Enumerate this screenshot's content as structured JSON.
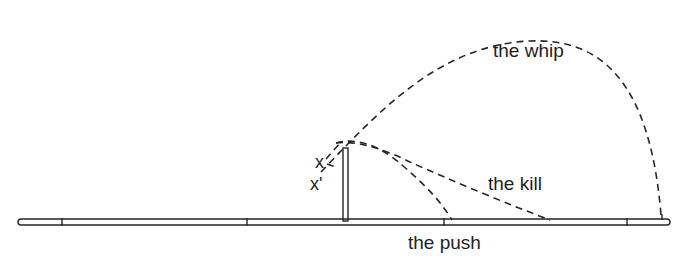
{
  "diagram": {
    "labels": {
      "whip": "the whip",
      "kill": "the kill",
      "push": "the push",
      "x": "x",
      "x_prime": "x'"
    },
    "colors": {
      "ink": "#262626",
      "background": "#ffffff"
    }
  }
}
